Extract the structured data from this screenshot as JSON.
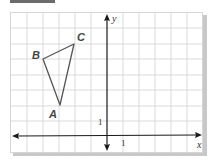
{
  "figure": {
    "type": "coordinate-plane",
    "axes": {
      "x_label": "x",
      "y_label": "y",
      "x_tick_label": "1",
      "y_tick_label": "1"
    },
    "triangle": {
      "vertices": [
        {
          "label": "A",
          "x": -3,
          "y": 2
        },
        {
          "label": "B",
          "x": -4,
          "y": 5
        },
        {
          "label": "C",
          "x": -2,
          "y": 6
        }
      ]
    },
    "colors": {
      "grid": "#d2d2d2",
      "axis": "#1a1a1a",
      "triangle": "#555555",
      "label": "#444444",
      "shadow": "#c8c8c8"
    }
  }
}
